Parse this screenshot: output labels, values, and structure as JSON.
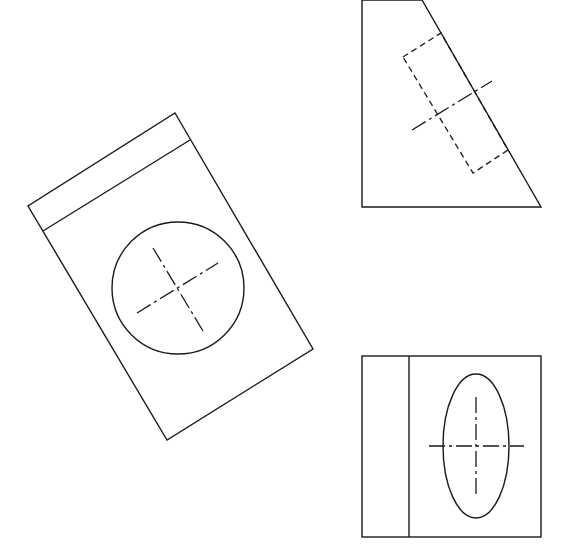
{
  "drawing": {
    "type": "orthographic-projection",
    "background": "#ffffff",
    "line_color": "#1a1a1a",
    "views": [
      {
        "id": "rotated-view",
        "outline": "175,113 313,349 167,440 28,206",
        "inner_line": {
          "x1": 43,
          "y1": 231,
          "x2": 190,
          "y2": 140
        },
        "circle": {
          "cx": 178,
          "cy": 288,
          "r": 66
        },
        "centerlines": [
          {
            "x1": 153,
            "y1": 248,
            "x2": 203,
            "y2": 331
          },
          {
            "x1": 137,
            "y1": 313,
            "x2": 218,
            "y2": 263
          }
        ]
      },
      {
        "id": "top-right-view",
        "outline": "362,0 422,0 541,207 362,207",
        "hidden_rect": "403,57 441,33 508,150 473,173",
        "centerline": {
          "x1": 412,
          "y1": 130,
          "x2": 492,
          "y2": 81
        }
      },
      {
        "id": "bottom-right-view",
        "rect": {
          "x": 362,
          "y": 356,
          "width": 179,
          "height": 181
        },
        "divider": {
          "x1": 409,
          "y1": 356,
          "x2": 409,
          "y2": 537
        },
        "ellipse": {
          "cx": 476,
          "cy": 446,
          "rx": 33,
          "ry": 72
        },
        "centerlines": [
          {
            "x1": 429,
            "y1": 446,
            "x2": 524,
            "y2": 446
          },
          {
            "x1": 476,
            "y1": 397,
            "x2": 476,
            "y2": 495
          }
        ]
      }
    ]
  }
}
